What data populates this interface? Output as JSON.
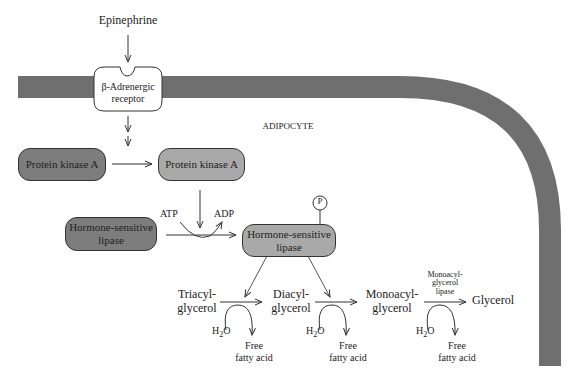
{
  "diagram": {
    "colors": {
      "membrane": "#6f6f6f",
      "inactive_box": "#7d7d7d",
      "active_box": "#a9a9a9",
      "receptor_fill": "#ffffff"
    },
    "signal": {
      "label": "Epinephrine"
    },
    "receptor": {
      "line1": "β-Adrenergic",
      "line2": "receptor"
    },
    "cell_label": "ADIPOCYTE",
    "pka_inactive": {
      "label": "Protein kinase A"
    },
    "pka_active": {
      "label": "Protein kinase A"
    },
    "hsl_inactive": {
      "line1": "Hormone-sensitive",
      "line2": "lipase"
    },
    "hsl_active": {
      "line1": "Hormone-sensitive",
      "line2": "lipase"
    },
    "phosphate": {
      "label": "P"
    },
    "atp": "ATP",
    "adp": "ADP",
    "substrates": {
      "tag": {
        "line1": "Triacyl-",
        "line2": "glycerol"
      },
      "dag": {
        "line1": "Diacyl-",
        "line2": "glycerol"
      },
      "mag": {
        "line1": "Monoacyl-",
        "line2": "glycerol"
      },
      "glycerol": "Glycerol"
    },
    "mgl_enzyme": {
      "line1": "Monoacyl-",
      "line2": "glycerol",
      "line3": "lipase"
    },
    "water": {
      "h": "H",
      "sub": "2",
      "o": "O"
    },
    "product": {
      "line1": "Free",
      "line2": "fatty acid"
    }
  }
}
